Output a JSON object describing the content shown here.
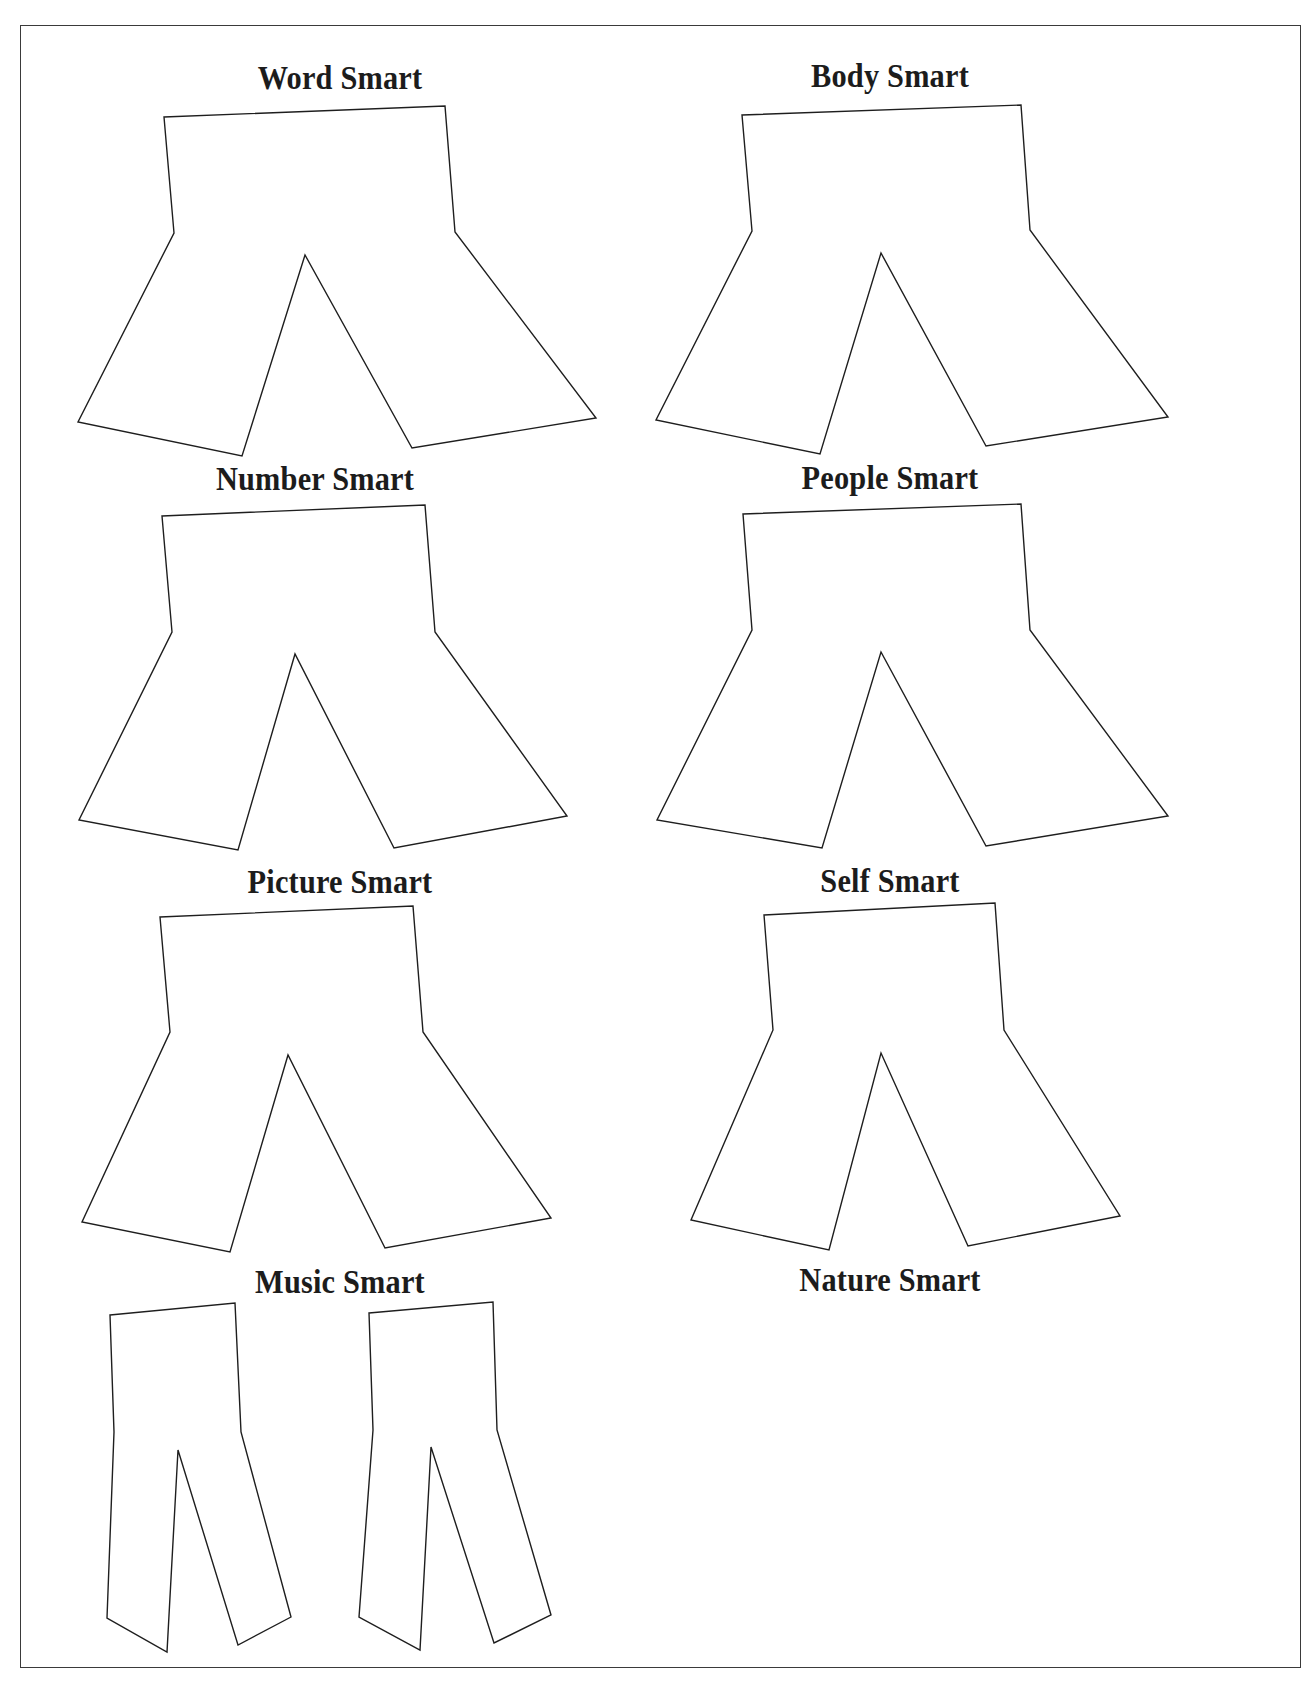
{
  "page": {
    "background": "#ffffff",
    "frame_color": "#3a3a3a",
    "outline_color": "#1e1e1e"
  },
  "panels": [
    {
      "label": "Word Smart",
      "label_pos": {
        "x": 140,
        "y": 62
      },
      "points": "164,117 445,106 455,232 596,418 412,448 305,255 242,456 78,422 174,233"
    },
    {
      "label": "Body Smart",
      "label_pos": {
        "x": 690,
        "y": 60
      },
      "points": "742,115 1021,105 1030,230 1168,417 986,446 881,253 820,454 656,420 752,231"
    },
    {
      "label": "Number Smart",
      "label_pos": {
        "x": 115,
        "y": 463
      },
      "points": "162,516 425,505 435,632 567,816 394,848 295,654 238,850 79,820 172,632"
    },
    {
      "label": "People Smart",
      "label_pos": {
        "x": 690,
        "y": 462
      },
      "points": "743,514 1021,504 1030,630 1168,816 986,846 881,652 822,848 657,820 752,630"
    },
    {
      "label": "Picture Smart",
      "label_pos": {
        "x": 140,
        "y": 866
      },
      "points": "160,917 413,906 423,1032 551,1218 385,1248 288,1055 230,1252 82,1222 170,1032"
    },
    {
      "label": "Self Smart",
      "label_pos": {
        "x": 690,
        "y": 865
      },
      "points": "764,915 995,903 1004,1030 1120,1216 968,1246 881,1053 829,1250 691,1220 773,1030"
    },
    {
      "label": "Music Smart",
      "label_pos": {
        "x": 140,
        "y": 1266
      },
      "points": "110,1315 235,1303 241,1432 291,1617 238,1645 178,1450 167,1652 107,1618 114,1432"
    },
    {
      "label": "Nature Smart",
      "label_pos": {
        "x": 690,
        "y": 1264
      },
      "points": "369,1313 493,1302 497,1430 551,1615 494,1643 431,1447 420,1650 359,1617 373,1430"
    }
  ]
}
